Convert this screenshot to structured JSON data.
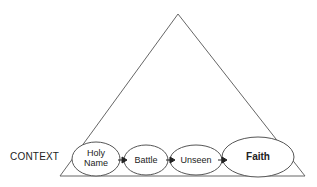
{
  "diagram": {
    "shape": "triangle",
    "context_label": "CONTEXT",
    "nodes": [
      {
        "id": "holy-name",
        "label_line1": "Holy",
        "label_line2": "Name",
        "bold": false
      },
      {
        "id": "battle",
        "label": "Battle",
        "bold": false
      },
      {
        "id": "unseen",
        "label": "Unseen",
        "bold": false
      },
      {
        "id": "faith",
        "label": "Faith",
        "bold": true
      }
    ],
    "edges": [
      {
        "from": "holy-name",
        "to": "battle"
      },
      {
        "from": "battle",
        "to": "unseen"
      },
      {
        "from": "unseen",
        "to": "faith"
      }
    ],
    "colors": {
      "stroke": "#555555",
      "text": "#222222",
      "background": "#ffffff"
    }
  }
}
